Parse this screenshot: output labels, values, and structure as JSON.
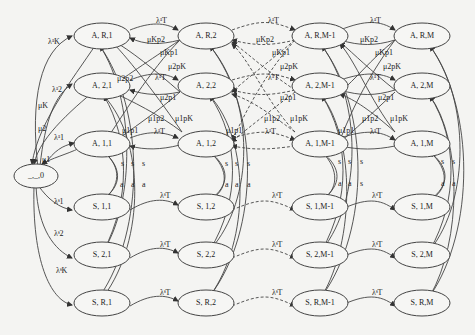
{
  "diagram": {
    "type": "state-transition-diagram",
    "nodes": {
      "origin": "_,_,0",
      "A_R1": "A, R,1",
      "A_R2": "A, R,2",
      "A_RM1": "A, R,M-1",
      "A_RM": "A, R,M",
      "A_21": "A, 2,1",
      "A_22": "A, 2,2",
      "A_2M1": "A, 2,M-1",
      "A_2M": "A, 2,M",
      "A_11": "A, 1,1",
      "A_12": "A, 1,2",
      "A_1M1": "A, 1,M-1",
      "A_1M": "A, 1,M",
      "S_11": "S, 1,1",
      "S_12": "S, 1,2",
      "S_1M1": "S, 1,M-1",
      "S_1M": "S, 1,M",
      "S_21": "S, 2,1",
      "S_22": "S, 2,2",
      "S_2M1": "S, 2,M-1",
      "S_2M": "S, 2,M",
      "S_R1": "S, R,1",
      "S_R2": "S, R,2",
      "S_RM1": "S, R,M-1",
      "S_RM": "S, R,M"
    },
    "labels": {
      "lam_a_K": "λᵃK",
      "lam_a_2": "λᵃ2",
      "lam_a_1": "λᵃ1",
      "lam_s_1": "λˢ1",
      "lam_s_2": "λˢ2",
      "lam_s_K": "λˢK",
      "mu_K": "μK",
      "mu_2": "μ2",
      "mu_1": "μ1",
      "lam_a_T": "λᵃT",
      "lam_s_T": "λˢT",
      "muK_p2": "μKp2",
      "muK_p1": "μKp1",
      "mu2_pK": "μ2pK",
      "mu2_p2": "μ2p2",
      "mu2_p1": "μ2p1",
      "mu1_p2": "μ1p2",
      "mu1_pK": "μ1pK",
      "mu1_p1": "μ1p1",
      "s": "s",
      "a": "a"
    }
  }
}
